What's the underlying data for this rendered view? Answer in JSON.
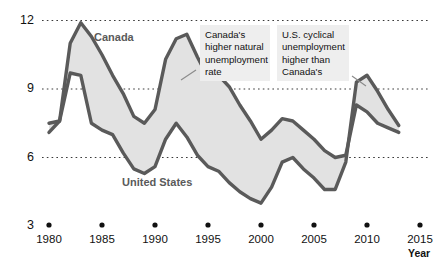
{
  "chart_data": {
    "type": "area",
    "title": "",
    "xlabel": "Year",
    "ylabel": "",
    "xlim": [
      1979,
      2015.5
    ],
    "ylim": [
      3,
      12
    ],
    "grid": "horizontal-dotted",
    "legend": "inline-labels",
    "x_ticks": [
      "1980",
      "1985",
      "1990",
      "1995",
      "2000",
      "2005",
      "2010",
      "2015"
    ],
    "y_ticks": [
      "3",
      "6",
      "9",
      "12"
    ],
    "x": [
      1980,
      1981,
      1982,
      1983,
      1984,
      1985,
      1986,
      1987,
      1988,
      1989,
      1990,
      1991,
      1992,
      1993,
      1994,
      1995,
      1996,
      1997,
      1998,
      1999,
      2000,
      2001,
      2002,
      2003,
      2004,
      2005,
      2006,
      2007,
      2008,
      2009,
      2010,
      2011,
      2012,
      2013
    ],
    "series": [
      {
        "name": "Canada",
        "values": [
          7.5,
          7.6,
          11.0,
          11.9,
          11.3,
          10.5,
          9.6,
          8.8,
          7.8,
          7.5,
          8.1,
          10.3,
          11.2,
          11.4,
          10.4,
          9.5,
          9.6,
          9.1,
          8.3,
          7.6,
          6.8,
          7.2,
          7.7,
          7.6,
          7.2,
          6.8,
          6.3,
          6.0,
          6.1,
          8.3,
          8.0,
          7.5,
          7.3,
          7.1
        ]
      },
      {
        "name": "United States",
        "values": [
          7.1,
          7.6,
          9.7,
          9.6,
          7.5,
          7.2,
          7.0,
          6.2,
          5.5,
          5.3,
          5.6,
          6.8,
          7.5,
          6.9,
          6.1,
          5.6,
          5.4,
          4.9,
          4.5,
          4.2,
          4.0,
          4.7,
          5.8,
          6.0,
          5.5,
          5.1,
          4.6,
          4.6,
          5.8,
          9.3,
          9.6,
          8.9,
          8.1,
          7.4
        ]
      }
    ],
    "annotations": [
      "Canada's higher natural unemployment rate",
      "U.S. cyclical unemployment higher than Canada's"
    ]
  },
  "axes": {
    "y_labels": [
      "12",
      "9",
      "6",
      "3"
    ],
    "x_labels": [
      "1980",
      "1985",
      "1990",
      "1995",
      "2000",
      "2005",
      "2010",
      "2015"
    ],
    "year_axis_title": "Year"
  },
  "series_labels": {
    "canada": "Canada",
    "united_states": "United States"
  },
  "callouts": {
    "left": {
      "line1": "Canada's",
      "line2": "higher natural",
      "line3": "unemployment",
      "line4": "rate"
    },
    "right": {
      "line1": "U.S. cyclical",
      "line2": "unemployment",
      "line3": "higher than",
      "line4": "Canada's"
    }
  },
  "colors": {
    "line": "#5a5a5a",
    "band_fill": "#e2e2e2",
    "grid": "#3a3a3a",
    "callout_bg": "#eeeeee",
    "text": "#111111"
  }
}
